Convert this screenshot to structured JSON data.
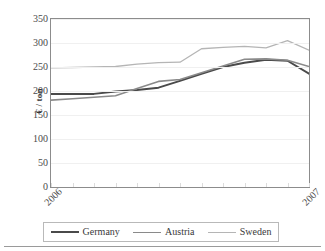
{
  "chart_data": {
    "type": "line",
    "title": "",
    "subtitle": "",
    "xlabel": "",
    "ylabel": "€ / ton",
    "ylim": [
      0,
      350
    ],
    "ytick_values": [
      0,
      50,
      100,
      150,
      200,
      250,
      300,
      350
    ],
    "ytick_labels": [
      "0",
      "50",
      "100",
      "150",
      "200",
      "250",
      "300",
      "350"
    ],
    "xtick_labels": [
      "2006",
      "2007"
    ],
    "xtick_positions": [
      0,
      12
    ],
    "x": [
      0,
      1,
      2,
      3,
      4,
      5,
      6,
      7,
      8,
      9,
      10,
      11,
      12
    ],
    "grid": true,
    "grid_axis": "y",
    "legend_position": "bottom",
    "series": [
      {
        "name": "Germany",
        "color": "#4a4a4a",
        "width": 2.0,
        "values": [
          194,
          194,
          194,
          199,
          202,
          207,
          221,
          236,
          250,
          259,
          265,
          263,
          236
        ]
      },
      {
        "name": "Austria",
        "color": "#8a8a8a",
        "width": 1.6,
        "values": [
          181,
          184,
          187,
          190,
          205,
          220,
          224,
          238,
          252,
          266,
          267,
          264,
          251
        ]
      },
      {
        "name": "Sweden",
        "color": "#b5b5b5",
        "width": 1.3,
        "values": [
          248,
          249,
          250,
          251,
          256,
          259,
          260,
          288,
          291,
          293,
          290,
          305,
          285
        ]
      }
    ]
  },
  "legend": {
    "entries": [
      "Germany",
      "Austria",
      "Sweden"
    ]
  }
}
